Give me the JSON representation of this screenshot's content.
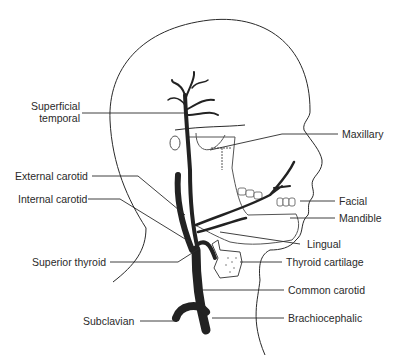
{
  "diagram": {
    "colors": {
      "line": "#2a2a2a",
      "artery": "#222222",
      "background": "#ffffff"
    },
    "labels_left": [
      {
        "id": "superficial-temporal",
        "line1": "Superficial",
        "line2": "temporal"
      },
      {
        "id": "external-carotid",
        "text": "External carotid"
      },
      {
        "id": "internal-carotid",
        "text": "Internal carotid"
      },
      {
        "id": "superior-thyroid",
        "text": "Superior thyroid"
      },
      {
        "id": "subclavian",
        "text": "Subclavian"
      }
    ],
    "labels_right": [
      {
        "id": "maxillary",
        "text": "Maxillary"
      },
      {
        "id": "facial",
        "text": "Facial"
      },
      {
        "id": "mandible",
        "text": "Mandible"
      },
      {
        "id": "lingual",
        "text": "Lingual"
      },
      {
        "id": "thyroid-cartilage",
        "text": "Thyroid cartilage"
      },
      {
        "id": "common-carotid",
        "text": "Common carotid"
      },
      {
        "id": "brachiocephalic",
        "text": "Brachiocephalic"
      }
    ]
  }
}
